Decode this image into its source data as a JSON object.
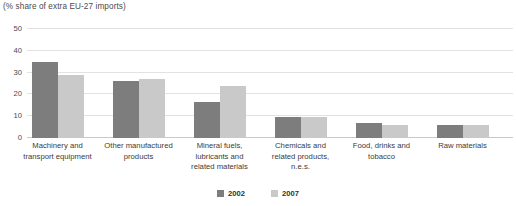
{
  "chart_data": {
    "type": "bar",
    "title": "(% share of extra EU-27 imports)",
    "xlabel": "",
    "ylabel": "",
    "ylim": [
      0,
      50
    ],
    "yticks": [
      0,
      10,
      20,
      30,
      40,
      50
    ],
    "ytick_labels": [
      "0",
      "10",
      "20",
      "30",
      "40",
      "50"
    ],
    "grid": true,
    "legend_position": "bottom-center",
    "categories": [
      "Machinery and transport equipment",
      "Other manufactured products",
      "Mineral fuels, lubricants and related materials",
      "Chemicals and related products, n.e.s.",
      "Food, drinks and tobacco",
      "Raw materials"
    ],
    "category_lines": [
      [
        "Machinery and",
        "transport equipment"
      ],
      [
        "Other manufactured",
        "products"
      ],
      [
        "Mineral fuels,",
        "lubricants and",
        "related materials"
      ],
      [
        "Chemicals and",
        "related products,",
        "n.e.s."
      ],
      [
        "Food, drinks and",
        "tobacco"
      ],
      [
        "Raw materials"
      ]
    ],
    "series": [
      {
        "name": "2002",
        "color": "#7d7d7d",
        "values": [
          35,
          26,
          16.5,
          9.5,
          7,
          6
        ]
      },
      {
        "name": "2007",
        "color": "#c9c9c9",
        "values": [
          29,
          27,
          24,
          9.5,
          6,
          6
        ]
      }
    ]
  },
  "legend": {
    "items": [
      {
        "label": "2002",
        "color": "#7d7d7d"
      },
      {
        "label": "2007",
        "color": "#c9c9c9"
      }
    ]
  }
}
